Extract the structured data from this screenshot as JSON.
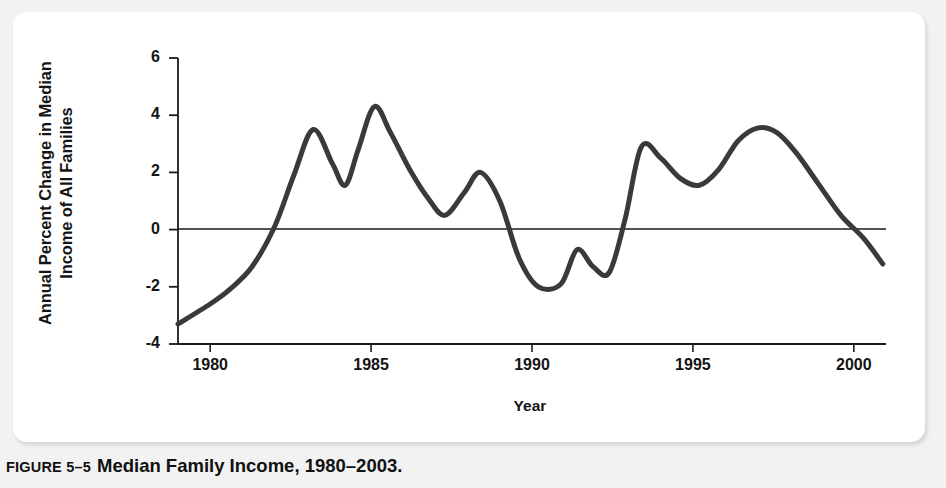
{
  "caption": {
    "number": "FIGURE 5–5",
    "title": "Median Family Income, 1980–2003."
  },
  "colors": {
    "line": "#3a3a3a",
    "axis": "#1a1a1a",
    "panel_bg": "#ffffff",
    "page_bg": "#f2f2f2",
    "text": "#141414"
  },
  "chart_data": {
    "type": "line",
    "title": "Median Family Income, 1980–2003",
    "xlabel": "Year",
    "ylabel": "Annual Percent Change in Median Income of All Families",
    "xlim": [
      1979,
      2001
    ],
    "ylim": [
      -4,
      6
    ],
    "xticks": [
      "1980",
      "1985",
      "1990",
      "1995",
      "2000"
    ],
    "xtick_values": [
      1980,
      1985,
      1990,
      1995,
      2000
    ],
    "yticks": [
      "6",
      "4",
      "2",
      "0",
      "-2",
      "-4"
    ],
    "ytick_values": [
      6,
      4,
      2,
      0,
      -2,
      -4
    ],
    "grid": false,
    "zero_line": true,
    "legend": null,
    "series": [
      {
        "name": "Annual percent change in median income of all families",
        "x": [
          1979.0,
          1980.0,
          1980.6,
          1981.3,
          1982.0,
          1982.6,
          1983.2,
          1983.8,
          1984.2,
          1984.6,
          1985.1,
          1985.6,
          1986.2,
          1986.8,
          1987.3,
          1987.9,
          1988.4,
          1989.0,
          1989.6,
          1990.2,
          1990.9,
          1991.4,
          1991.9,
          1992.4,
          1992.9,
          1993.4,
          1994.0,
          1994.6,
          1995.2,
          1995.8,
          1996.4,
          1997.0,
          1997.6,
          1998.2,
          1998.9,
          1999.6,
          2000.3,
          2000.9
        ],
        "y": [
          -3.3,
          -2.6,
          -2.1,
          -1.3,
          0.1,
          1.9,
          3.5,
          2.3,
          1.55,
          2.8,
          4.3,
          3.4,
          2.1,
          1.05,
          0.5,
          1.3,
          2.0,
          1.0,
          -1.0,
          -2.0,
          -1.9,
          -0.7,
          -1.3,
          -1.5,
          0.4,
          2.9,
          2.5,
          1.8,
          1.55,
          2.1,
          3.1,
          3.55,
          3.4,
          2.7,
          1.6,
          0.5,
          -0.3,
          -1.2
        ]
      }
    ],
    "notable_points": [
      {
        "year": 1979,
        "value": -3.3,
        "note": "series start"
      },
      {
        "year": 1982,
        "value": 0.1,
        "note": "crosses zero upward"
      },
      {
        "year": 1983,
        "value": 3.5,
        "note": "local peak"
      },
      {
        "year": 1984,
        "value": 1.55,
        "note": "local trough"
      },
      {
        "year": 1985,
        "value": 4.3,
        "note": "highest peak"
      },
      {
        "year": 1987,
        "value": 0.5,
        "note": "local trough"
      },
      {
        "year": 1988,
        "value": 2.0,
        "note": "local peak"
      },
      {
        "year": 1990,
        "value": -2.0,
        "note": "lowest trough after 1980"
      },
      {
        "year": 1991,
        "value": -0.7,
        "note": "local bump"
      },
      {
        "year": 1992,
        "value": -1.5,
        "note": "local trough"
      },
      {
        "year": 1993,
        "value": 2.9,
        "note": "local peak"
      },
      {
        "year": 1995,
        "value": 1.55,
        "note": "local trough"
      },
      {
        "year": 1997,
        "value": 3.55,
        "note": "local peak"
      },
      {
        "year": 2000,
        "value": -0.3,
        "note": "crosses zero downward"
      },
      {
        "year": 2001,
        "value": -1.2,
        "note": "series end"
      }
    ]
  }
}
